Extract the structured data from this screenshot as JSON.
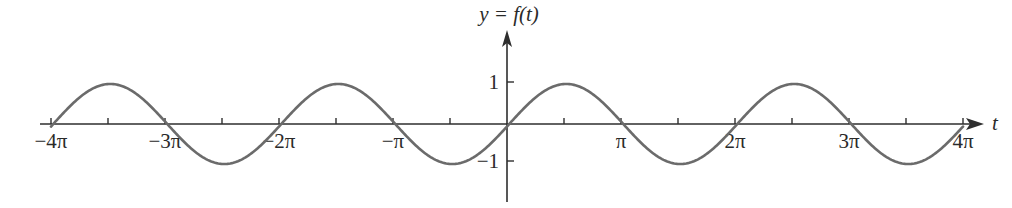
{
  "chart_data": {
    "type": "line",
    "title": "",
    "function_label": "y = f(t)",
    "xlabel": "t",
    "ylabel": "y = f(t)",
    "xlim_pi_units": [
      -4,
      4
    ],
    "ylim": [
      -1.6,
      2.2
    ],
    "grid": false,
    "legend": "none",
    "x_ticks": [
      {
        "value_pi": -4,
        "label": "−4π"
      },
      {
        "value_pi": -3.5,
        "label": ""
      },
      {
        "value_pi": -3,
        "label": "−3π"
      },
      {
        "value_pi": -2.5,
        "label": ""
      },
      {
        "value_pi": -2,
        "label": "−2π"
      },
      {
        "value_pi": -1.5,
        "label": ""
      },
      {
        "value_pi": -1,
        "label": "−π"
      },
      {
        "value_pi": -0.5,
        "label": ""
      },
      {
        "value_pi": 0.5,
        "label": ""
      },
      {
        "value_pi": 1,
        "label": "π"
      },
      {
        "value_pi": 1.5,
        "label": ""
      },
      {
        "value_pi": 2,
        "label": "2π"
      },
      {
        "value_pi": 2.5,
        "label": ""
      },
      {
        "value_pi": 3,
        "label": "3π"
      },
      {
        "value_pi": 3.5,
        "label": ""
      },
      {
        "value_pi": 4,
        "label": "4π"
      }
    ],
    "y_ticks": [
      {
        "value": 1,
        "label": "1"
      },
      {
        "value": -1,
        "label": "−1"
      }
    ],
    "series": [
      {
        "name": "f(t)",
        "description": "sinusoid of amplitude 1 and period 2π, approximately sin(t) with a slight phase lag",
        "amplitude": 1,
        "period_pi": 2,
        "phase_shift_pi": 0.02,
        "domain_pi": [
          -4,
          4
        ],
        "key_points": [
          {
            "t_pi": -4,
            "y": 0
          },
          {
            "t_pi": -3.5,
            "y": 1
          },
          {
            "t_pi": -3,
            "y": 0
          },
          {
            "t_pi": -2.5,
            "y": -1
          },
          {
            "t_pi": -2,
            "y": 0
          },
          {
            "t_pi": -1.5,
            "y": 1
          },
          {
            "t_pi": -1,
            "y": 0
          },
          {
            "t_pi": -0.5,
            "y": -1
          },
          {
            "t_pi": 0,
            "y": 0
          },
          {
            "t_pi": 0.5,
            "y": 1
          },
          {
            "t_pi": 1,
            "y": 0
          },
          {
            "t_pi": 1.5,
            "y": -1
          },
          {
            "t_pi": 2,
            "y": 0
          },
          {
            "t_pi": 2.5,
            "y": 1
          },
          {
            "t_pi": 3,
            "y": 0
          },
          {
            "t_pi": 3.5,
            "y": -1
          },
          {
            "t_pi": 4,
            "y": 0
          }
        ],
        "color": "#6b6b6b"
      }
    ],
    "axis_color": "#2e2e2e"
  }
}
